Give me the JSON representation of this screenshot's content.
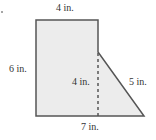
{
  "figure": {
    "type": "composite-shape",
    "colors": {
      "fill": "#ececec",
      "stroke": "#555555",
      "dashed": "#555555",
      "text": "#333333"
    },
    "vertices": [
      {
        "x": 36,
        "y": 20
      },
      {
        "x": 98,
        "y": 20
      },
      {
        "x": 98,
        "y": 52
      },
      {
        "x": 144,
        "y": 116
      },
      {
        "x": 36,
        "y": 116
      }
    ],
    "dashed_height": {
      "x": 98,
      "y1": 52,
      "y2": 116
    }
  },
  "labels": {
    "top": "4 in.",
    "left": "6 in.",
    "inner_height": "4 in.",
    "slant": "5 in.",
    "bottom": "7 in."
  }
}
